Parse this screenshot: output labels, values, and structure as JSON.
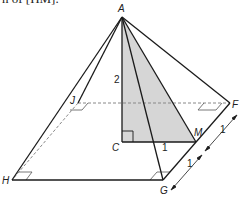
{
  "caption_fragment": "n of [HM].",
  "diagram": {
    "type": "square-based pyramid",
    "vertices": {
      "A": "A",
      "J": "J",
      "F": "F",
      "H": "H",
      "G": "G",
      "C": "C",
      "M": "M"
    },
    "measurements": {
      "AC": "2",
      "CM": "1",
      "FM": "1",
      "MG": "1"
    },
    "colors": {
      "line": "#1a1a1a",
      "shade": "#d6d6d6",
      "dashed": "#888888"
    }
  }
}
